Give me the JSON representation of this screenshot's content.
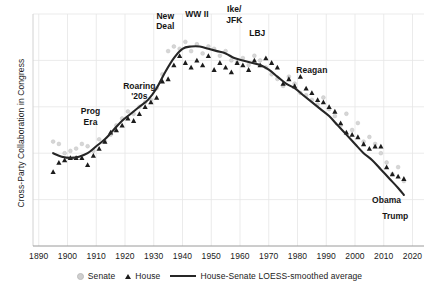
{
  "chart_data": {
    "type": "scatter",
    "title": "",
    "xlabel": "",
    "ylabel": "Cross-Party Collaboration in Congress",
    "xlim": [
      1888,
      2024
    ],
    "ylim": [
      0,
      100
    ],
    "xticks": [
      "1890",
      "1900",
      "1910",
      "1920",
      "1930",
      "1940",
      "1950",
      "1960",
      "1970",
      "1980",
      "1990",
      "2000",
      "2010",
      "2020"
    ],
    "yticks": [],
    "grid": true,
    "legend_position": "bottom-center",
    "legend": [
      {
        "name": "Senate",
        "marker": "circle",
        "color": "#cfcfcf"
      },
      {
        "name": "House",
        "marker": "triangle",
        "color": "#1c1c1c"
      },
      {
        "name": "House-Senate LOESS-smoothed average",
        "marker": "line",
        "color": "#262626"
      }
    ],
    "series": [
      {
        "name": "Senate",
        "marker": "circle",
        "color": "#cfcfcf",
        "points": [
          [
            1895,
            45
          ],
          [
            1897,
            44
          ],
          [
            1899,
            40
          ],
          [
            1901,
            41
          ],
          [
            1903,
            42
          ],
          [
            1905,
            44
          ],
          [
            1907,
            43
          ],
          [
            1909,
            41
          ],
          [
            1911,
            46
          ],
          [
            1913,
            45
          ],
          [
            1915,
            48
          ],
          [
            1917,
            52
          ],
          [
            1919,
            55
          ],
          [
            1921,
            58
          ],
          [
            1923,
            57
          ],
          [
            1925,
            60
          ],
          [
            1927,
            62
          ],
          [
            1929,
            63
          ],
          [
            1931,
            68
          ],
          [
            1933,
            74
          ],
          [
            1935,
            84
          ],
          [
            1937,
            86
          ],
          [
            1939,
            85
          ],
          [
            1941,
            88
          ],
          [
            1943,
            84
          ],
          [
            1945,
            87
          ],
          [
            1947,
            83
          ],
          [
            1949,
            86
          ],
          [
            1951,
            85
          ],
          [
            1953,
            82
          ],
          [
            1955,
            84
          ],
          [
            1957,
            80
          ],
          [
            1959,
            79
          ],
          [
            1961,
            81
          ],
          [
            1963,
            78
          ],
          [
            1965,
            82
          ],
          [
            1967,
            80
          ],
          [
            1969,
            77
          ],
          [
            1971,
            74
          ],
          [
            1973,
            72
          ],
          [
            1975,
            69
          ],
          [
            1977,
            73
          ],
          [
            1979,
            70
          ],
          [
            1981,
            66
          ],
          [
            1983,
            65
          ],
          [
            1985,
            63
          ],
          [
            1987,
            61
          ],
          [
            1989,
            64
          ],
          [
            1991,
            59
          ],
          [
            1993,
            56
          ],
          [
            1995,
            52
          ],
          [
            1997,
            57
          ],
          [
            1999,
            50
          ],
          [
            2001,
            53
          ],
          [
            2003,
            45
          ],
          [
            2005,
            47
          ],
          [
            2007,
            44
          ],
          [
            2009,
            40
          ],
          [
            2011,
            36
          ],
          [
            2013,
            31
          ],
          [
            2015,
            34
          ],
          [
            2017,
            28
          ]
        ]
      },
      {
        "name": "House",
        "marker": "triangle",
        "color": "#1c1c1c",
        "points": [
          [
            1895,
            32
          ],
          [
            1897,
            36
          ],
          [
            1899,
            37
          ],
          [
            1901,
            38
          ],
          [
            1903,
            38
          ],
          [
            1905,
            38
          ],
          [
            1907,
            35
          ],
          [
            1909,
            39
          ],
          [
            1911,
            42
          ],
          [
            1913,
            45
          ],
          [
            1915,
            49
          ],
          [
            1917,
            50
          ],
          [
            1919,
            52
          ],
          [
            1921,
            55
          ],
          [
            1923,
            54
          ],
          [
            1925,
            57
          ],
          [
            1927,
            60
          ],
          [
            1929,
            62
          ],
          [
            1931,
            64
          ],
          [
            1933,
            71
          ],
          [
            1935,
            72
          ],
          [
            1937,
            78
          ],
          [
            1939,
            82
          ],
          [
            1941,
            79
          ],
          [
            1943,
            77
          ],
          [
            1945,
            80
          ],
          [
            1947,
            78
          ],
          [
            1949,
            82
          ],
          [
            1951,
            76
          ],
          [
            1953,
            79
          ],
          [
            1955,
            77
          ],
          [
            1957,
            75
          ],
          [
            1959,
            79
          ],
          [
            1961,
            78
          ],
          [
            1963,
            76
          ],
          [
            1965,
            80
          ],
          [
            1967,
            78
          ],
          [
            1969,
            81
          ],
          [
            1971,
            79
          ],
          [
            1973,
            77
          ],
          [
            1975,
            70
          ],
          [
            1977,
            72
          ],
          [
            1979,
            69
          ],
          [
            1981,
            73
          ],
          [
            1983,
            68
          ],
          [
            1985,
            66
          ],
          [
            1987,
            63
          ],
          [
            1989,
            62
          ],
          [
            1991,
            60
          ],
          [
            1993,
            58
          ],
          [
            1995,
            53
          ],
          [
            1997,
            49
          ],
          [
            1999,
            48
          ],
          [
            2001,
            47
          ],
          [
            2003,
            44
          ],
          [
            2005,
            42
          ],
          [
            2007,
            43
          ],
          [
            2009,
            43
          ],
          [
            2011,
            34
          ],
          [
            2013,
            31
          ],
          [
            2015,
            30
          ],
          [
            2017,
            29
          ]
        ]
      }
    ],
    "loess_line": {
      "name": "House-Senate LOESS-smoothed average",
      "color": "#262626",
      "points": [
        [
          1895,
          40
        ],
        [
          1898,
          38.5
        ],
        [
          1901,
          38
        ],
        [
          1904,
          38.5
        ],
        [
          1907,
          40
        ],
        [
          1910,
          43
        ],
        [
          1913,
          46
        ],
        [
          1916,
          50
        ],
        [
          1919,
          54
        ],
        [
          1922,
          57
        ],
        [
          1925,
          60
        ],
        [
          1928,
          63
        ],
        [
          1931,
          68
        ],
        [
          1934,
          75
        ],
        [
          1937,
          81
        ],
        [
          1940,
          85
        ],
        [
          1943,
          86
        ],
        [
          1946,
          86
        ],
        [
          1949,
          85
        ],
        [
          1952,
          84
        ],
        [
          1955,
          83
        ],
        [
          1958,
          81
        ],
        [
          1961,
          80
        ],
        [
          1964,
          79
        ],
        [
          1967,
          78
        ],
        [
          1970,
          76
        ],
        [
          1973,
          73
        ],
        [
          1976,
          70
        ],
        [
          1979,
          68
        ],
        [
          1982,
          65
        ],
        [
          1985,
          62
        ],
        [
          1988,
          59
        ],
        [
          1991,
          56
        ],
        [
          1994,
          52
        ],
        [
          1997,
          48
        ],
        [
          2000,
          44
        ],
        [
          2003,
          40
        ],
        [
          2006,
          37
        ],
        [
          2009,
          33
        ],
        [
          2012,
          29
        ],
        [
          2015,
          25
        ],
        [
          2017,
          22
        ]
      ]
    },
    "annotations": [
      {
        "id": "prog-era",
        "text": "Prog\nEra",
        "x": 1908,
        "y": 56
      },
      {
        "id": "roaring-20s",
        "text": "Roaring\n'20s",
        "x": 1925,
        "y": 67
      },
      {
        "id": "new-deal",
        "text": "New\nDeal",
        "x": 1934,
        "y": 97
      },
      {
        "id": "ww2",
        "text": "WW II",
        "x": 1945,
        "y": 100
      },
      {
        "id": "ike-jfk",
        "text": "Ike/\nJFK",
        "x": 1958,
        "y": 100
      },
      {
        "id": "lbj",
        "text": "LBJ",
        "x": 1966,
        "y": 92
      },
      {
        "id": "reagan",
        "text": "Reagan",
        "x": 1985,
        "y": 76
      },
      {
        "id": "obama",
        "text": "Obama",
        "x": 2011,
        "y": 20
      },
      {
        "id": "trump",
        "text": "Trump",
        "x": 2014,
        "y": 13
      }
    ]
  }
}
